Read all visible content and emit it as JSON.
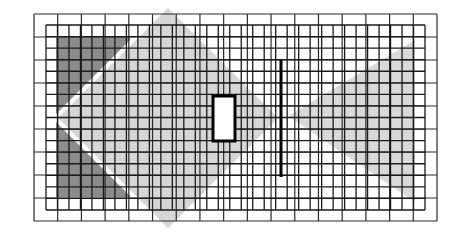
{
  "diagram": {
    "type": "grid-coverage-map",
    "canvas": {
      "width": 456,
      "height": 234,
      "background": "#ffffff"
    },
    "outer_frame": {
      "x": 34,
      "y": 14,
      "width": 403,
      "height": 207,
      "cols": 17,
      "rows": 9,
      "stroke": "#2a2a2a"
    },
    "inner_grid": {
      "x": 46,
      "y": 25,
      "width": 379,
      "height": 185,
      "cols": 33,
      "rows": 16,
      "stroke": "#1a1a1a"
    },
    "colors": {
      "dark_region": "#8c8c8c",
      "light_region": "#d6d6d6",
      "wedge_region": "#d9d9d9",
      "separator_gap": "#ffffff",
      "obstacle_stroke": "#000000",
      "obstacle_fill": "#ffffff"
    },
    "regions": {
      "dark_block": {
        "x": 56,
        "y": 37,
        "width": 74,
        "height": 160
      },
      "light_diamond": {
        "cx": 168,
        "cy": 118,
        "half_diag": 110
      },
      "right_wedge": {
        "points": "288,116 415,40 415,202"
      }
    },
    "obstacles": {
      "rectangle": {
        "x": 213,
        "y": 96,
        "width": 22,
        "height": 45,
        "stroke_width": 3
      },
      "wall": {
        "x": 281,
        "y1": 60,
        "y2": 177,
        "stroke_width": 3
      }
    }
  }
}
